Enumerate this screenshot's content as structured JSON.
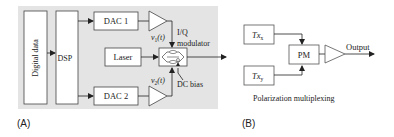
{
  "panel_a": {
    "label": "(A)",
    "digital_data": "Digital data",
    "dsp": "DSP",
    "dac1": "DAC 1",
    "dac2": "DAC 2",
    "laser": "Laser",
    "v1": "v",
    "v1_sub": "1",
    "v1_arg": "(t)",
    "v2": "v",
    "v2_sub": "2",
    "v2_arg": "(t)",
    "iq_line1": "I/Q",
    "iq_line2": "modulator",
    "dc_bias": "DC bias"
  },
  "panel_b": {
    "label": "(B)",
    "tx_x": "Tx",
    "tx_x_sub": "x",
    "tx_y": "Tx",
    "tx_y_sub": "y",
    "pm": "PM",
    "output": "Output",
    "caption": "Polarization multiplexing"
  },
  "colors": {
    "panel_bg": "#e4e4e4",
    "line": "#222222",
    "box_fill": "#ffffff"
  }
}
